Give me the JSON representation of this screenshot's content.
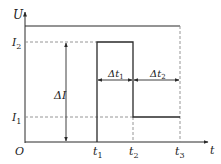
{
  "diagram": {
    "type": "current-voltage-timing",
    "colors": {
      "line": "#2a2a2a",
      "dashed": "#8a8a8a",
      "background": "#ffffff"
    },
    "axes": {
      "y_label": "U",
      "x_label": "t",
      "origin_label": "O"
    },
    "levels": {
      "i2_label": "I",
      "i2_sub": "2",
      "i1_label": "I",
      "i1_sub": "1"
    },
    "time_marks": [
      {
        "label": "t",
        "sub": "1"
      },
      {
        "label": "t",
        "sub": "2"
      },
      {
        "label": "t",
        "sub": "3"
      }
    ],
    "annotations": {
      "delta_i": "ΔI",
      "delta_t1": "Δt",
      "delta_t1_sub": "1",
      "delta_t2": "Δt",
      "delta_t2_sub": "2"
    }
  }
}
